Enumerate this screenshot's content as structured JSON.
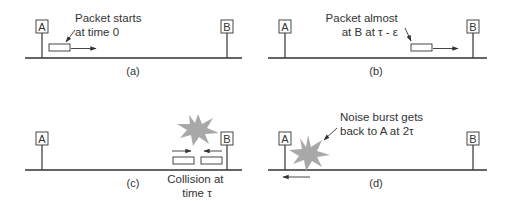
{
  "diagram": {
    "colors": {
      "line": "#333333",
      "burst": "#a8a8a8",
      "background": "#ffffff"
    },
    "panels": [
      {
        "id": "a",
        "caption": "(a)",
        "stations": [
          {
            "label": "A"
          },
          {
            "label": "B"
          }
        ],
        "annotation": [
          "Packet starts",
          "at time 0"
        ],
        "packets": [
          {
            "direction": "right"
          }
        ]
      },
      {
        "id": "b",
        "caption": "(b)",
        "stations": [
          {
            "label": "A"
          },
          {
            "label": "B"
          }
        ],
        "annotation": [
          "Packet almost",
          "at B at τ - ε"
        ],
        "packets": [
          {
            "direction": "right"
          }
        ]
      },
      {
        "id": "c",
        "caption": "(c)",
        "stations": [
          {
            "label": "A"
          },
          {
            "label": "B"
          }
        ],
        "annotation": [
          "Collision at",
          "time τ"
        ],
        "packets": [
          {
            "direction": "right"
          },
          {
            "direction": "left"
          }
        ],
        "burst": "collision-burst-icon"
      },
      {
        "id": "d",
        "caption": "(d)",
        "stations": [
          {
            "label": "A"
          },
          {
            "label": "B"
          }
        ],
        "annotation": [
          "Noise burst gets",
          "back to A  at 2τ"
        ],
        "packets": [],
        "burst": "noise-burst-icon",
        "arrow": "left"
      }
    ]
  }
}
